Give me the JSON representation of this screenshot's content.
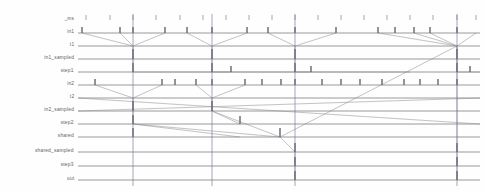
{
  "chart_data": {
    "type": "line",
    "title": "",
    "xlabel": "",
    "ylabel": "",
    "grid": true,
    "legend_position": "none",
    "lanes": [
      {
        "name": "_ms",
        "y": 20,
        "gridline": false
      },
      {
        "name": "in1",
        "y": 33,
        "gridline": true
      },
      {
        "name": "t1",
        "y": 46,
        "gridline": true
      },
      {
        "name": "in1_sampled",
        "y": 59,
        "gridline": true
      },
      {
        "name": "step1",
        "y": 72,
        "gridline": true
      },
      {
        "name": "in2",
        "y": 85,
        "gridline": true
      },
      {
        "name": "t2",
        "y": 98,
        "gridline": true
      },
      {
        "name": "in2_sampled",
        "y": 111,
        "gridline": true
      },
      {
        "name": "step2",
        "y": 124,
        "gridline": true
      },
      {
        "name": "shared",
        "y": 137,
        "gridline": true
      },
      {
        "name": "shared_sampled",
        "y": 152,
        "gridline": true
      },
      {
        "name": "step3",
        "y": 166,
        "gridline": true
      },
      {
        "name": "out",
        "y": 180,
        "gridline": true
      }
    ],
    "plot_area": {
      "x_left": 78,
      "x_right": 480,
      "y_top": 14,
      "y_bottom": 186
    },
    "axis_ticks_top": {
      "lane": "_ms",
      "y": 20,
      "x_values": [
        86,
        110,
        133,
        156,
        180,
        203,
        226,
        249,
        272,
        295,
        318,
        341,
        364,
        387,
        410,
        433,
        457,
        476
      ]
    },
    "time_cursors": [
      {
        "x": 133,
        "y_top": 14,
        "y_bottom": 186
      },
      {
        "x": 212,
        "y_top": 14,
        "y_bottom": 186
      },
      {
        "x": 295,
        "y_top": 14,
        "y_bottom": 186
      },
      {
        "x": 457,
        "y_top": 14,
        "y_bottom": 186
      }
    ],
    "events": [
      {
        "lane": "in1",
        "x": 82,
        "h": 6
      },
      {
        "lane": "in1",
        "x": 120,
        "h": 6
      },
      {
        "lane": "in1",
        "x": 133,
        "h": 6
      },
      {
        "lane": "in1",
        "x": 165,
        "h": 6
      },
      {
        "lane": "in1",
        "x": 187,
        "h": 6
      },
      {
        "lane": "in1",
        "x": 212,
        "h": 6
      },
      {
        "lane": "in1",
        "x": 247,
        "h": 6
      },
      {
        "lane": "in1",
        "x": 268,
        "h": 6
      },
      {
        "lane": "in1",
        "x": 295,
        "h": 6
      },
      {
        "lane": "in1",
        "x": 336,
        "h": 6
      },
      {
        "lane": "in1",
        "x": 378,
        "h": 6
      },
      {
        "lane": "in1",
        "x": 395,
        "h": 6
      },
      {
        "lane": "in1",
        "x": 414,
        "h": 6
      },
      {
        "lane": "in1",
        "x": 430,
        "h": 6
      },
      {
        "lane": "in1",
        "x": 457,
        "h": 6
      },
      {
        "lane": "in1_sampled",
        "x": 133,
        "h": 10
      },
      {
        "lane": "in1_sampled",
        "x": 212,
        "h": 10
      },
      {
        "lane": "in1_sampled",
        "x": 295,
        "h": 10
      },
      {
        "lane": "in1_sampled",
        "x": 457,
        "h": 10
      },
      {
        "lane": "step1",
        "x": 133,
        "h": 9
      },
      {
        "lane": "step1",
        "x": 212,
        "h": 9
      },
      {
        "lane": "step1",
        "x": 231,
        "h": 6
      },
      {
        "lane": "step1",
        "x": 295,
        "h": 9
      },
      {
        "lane": "step1",
        "x": 311,
        "h": 6
      },
      {
        "lane": "step1",
        "x": 457,
        "h": 9
      },
      {
        "lane": "step1",
        "x": 470,
        "h": 6
      },
      {
        "lane": "in2",
        "x": 95,
        "h": 6
      },
      {
        "lane": "in2",
        "x": 162,
        "h": 6
      },
      {
        "lane": "in2",
        "x": 175,
        "h": 6
      },
      {
        "lane": "in2",
        "x": 196,
        "h": 6
      },
      {
        "lane": "in2",
        "x": 212,
        "h": 6
      },
      {
        "lane": "in2",
        "x": 245,
        "h": 6
      },
      {
        "lane": "in2",
        "x": 262,
        "h": 6
      },
      {
        "lane": "in2",
        "x": 281,
        "h": 6
      },
      {
        "lane": "in2",
        "x": 295,
        "h": 6
      },
      {
        "lane": "in2",
        "x": 322,
        "h": 6
      },
      {
        "lane": "in2",
        "x": 341,
        "h": 6
      },
      {
        "lane": "in2",
        "x": 360,
        "h": 6
      },
      {
        "lane": "in2",
        "x": 382,
        "h": 6
      },
      {
        "lane": "in2",
        "x": 404,
        "h": 6
      },
      {
        "lane": "in2",
        "x": 420,
        "h": 6
      },
      {
        "lane": "in2",
        "x": 438,
        "h": 6
      },
      {
        "lane": "in2",
        "x": 457,
        "h": 6
      },
      {
        "lane": "in2_sampled",
        "x": 133,
        "h": 10
      },
      {
        "lane": "in2_sampled",
        "x": 212,
        "h": 10
      },
      {
        "lane": "step2",
        "x": 133,
        "h": 9
      },
      {
        "lane": "step2",
        "x": 240,
        "h": 8
      },
      {
        "lane": "shared",
        "x": 133,
        "h": 9
      },
      {
        "lane": "shared",
        "x": 280,
        "h": 9
      },
      {
        "lane": "shared_sampled",
        "x": 295,
        "h": 9
      },
      {
        "lane": "shared_sampled",
        "x": 457,
        "h": 9
      },
      {
        "lane": "step3",
        "x": 295,
        "h": 9
      },
      {
        "lane": "step3",
        "x": 457,
        "h": 9
      },
      {
        "lane": "out",
        "x": 295,
        "h": 9
      },
      {
        "lane": "out",
        "x": 457,
        "h": 9
      }
    ],
    "arrows": [
      {
        "from": [
          82,
          33
        ],
        "to": [
          133,
          46
        ]
      },
      {
        "from": [
          120,
          33
        ],
        "to": [
          133,
          46
        ]
      },
      {
        "from": [
          165,
          33
        ],
        "to": [
          133,
          46
        ]
      },
      {
        "from": [
          187,
          33
        ],
        "to": [
          212,
          46
        ]
      },
      {
        "from": [
          247,
          33
        ],
        "to": [
          212,
          46
        ]
      },
      {
        "from": [
          268,
          33
        ],
        "to": [
          295,
          46
        ]
      },
      {
        "from": [
          336,
          33
        ],
        "to": [
          295,
          46
        ]
      },
      {
        "from": [
          378,
          33
        ],
        "to": [
          457,
          46
        ]
      },
      {
        "from": [
          414,
          33
        ],
        "to": [
          457,
          46
        ]
      },
      {
        "from": [
          430,
          33
        ],
        "to": [
          457,
          46
        ]
      },
      {
        "from": [
          476,
          33
        ],
        "to": [
          457,
          46
        ]
      },
      {
        "from": [
          133,
          46
        ],
        "to": [
          133,
          59
        ]
      },
      {
        "from": [
          212,
          46
        ],
        "to": [
          212,
          59
        ]
      },
      {
        "from": [
          295,
          46
        ],
        "to": [
          295,
          59
        ]
      },
      {
        "from": [
          457,
          46
        ],
        "to": [
          457,
          59
        ]
      },
      {
        "from": [
          133,
          59
        ],
        "to": [
          133,
          72
        ]
      },
      {
        "from": [
          212,
          59
        ],
        "to": [
          212,
          72
        ]
      },
      {
        "from": [
          295,
          59
        ],
        "to": [
          295,
          72
        ]
      },
      {
        "from": [
          457,
          59
        ],
        "to": [
          457,
          72
        ]
      },
      {
        "from": [
          133,
          72
        ],
        "to": [
          231,
          72
        ]
      },
      {
        "from": [
          212,
          72
        ],
        "to": [
          311,
          72
        ]
      },
      {
        "from": [
          295,
          72
        ],
        "to": [
          410,
          72
        ]
      },
      {
        "from": [
          457,
          72
        ],
        "to": [
          480,
          72
        ]
      },
      {
        "from": [
          95,
          85
        ],
        "to": [
          133,
          98
        ]
      },
      {
        "from": [
          162,
          85
        ],
        "to": [
          133,
          98
        ]
      },
      {
        "from": [
          196,
          85
        ],
        "to": [
          212,
          98
        ]
      },
      {
        "from": [
          245,
          85
        ],
        "to": [
          212,
          98
        ]
      },
      {
        "from": [
          133,
          98
        ],
        "to": [
          133,
          111
        ]
      },
      {
        "from": [
          212,
          98
        ],
        "to": [
          212,
          111
        ]
      },
      {
        "from": [
          133,
          111
        ],
        "to": [
          133,
          124
        ]
      },
      {
        "from": [
          212,
          111
        ],
        "to": [
          240,
          124
        ]
      },
      {
        "from": [
          133,
          124
        ],
        "to": [
          240,
          137
        ]
      },
      {
        "from": [
          133,
          124
        ],
        "to": [
          280,
          137
        ]
      },
      {
        "from": [
          212,
          111
        ],
        "to": [
          280,
          137
        ]
      },
      {
        "from": [
          280,
          137
        ],
        "to": [
          295,
          152
        ]
      },
      {
        "from": [
          295,
          152
        ],
        "to": [
          295,
          166
        ]
      },
      {
        "from": [
          295,
          166
        ],
        "to": [
          295,
          180
        ]
      },
      {
        "from": [
          280,
          137
        ],
        "to": [
          457,
          46
        ]
      },
      {
        "from": [
          457,
          46
        ],
        "to": [
          457,
          152
        ]
      },
      {
        "from": [
          457,
          152
        ],
        "to": [
          457,
          166
        ]
      },
      {
        "from": [
          457,
          166
        ],
        "to": [
          457,
          180
        ]
      },
      {
        "from": [
          78,
          98
        ],
        "to": [
          480,
          124
        ]
      },
      {
        "from": [
          78,
          111
        ],
        "to": [
          480,
          98
        ]
      }
    ]
  },
  "colors": {
    "gridline": "#5a5a5a",
    "cursor": "#6d6d8a",
    "event": "#6b6b78",
    "arrow": "#8a8a95",
    "label": "#4a4a4a",
    "background": "#fefefe"
  }
}
